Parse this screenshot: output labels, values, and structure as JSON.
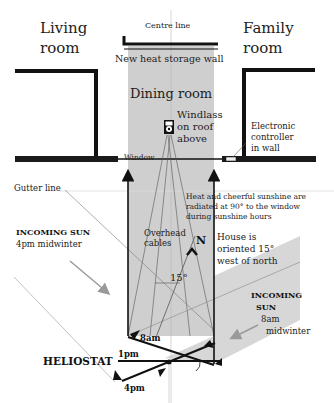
{
  "rooms": {
    "living": [
      "Living",
      "room"
    ],
    "family": [
      "Family",
      "room"
    ],
    "dining": "Dining room"
  },
  "labels": {
    "centre_line": "Centre line",
    "heat_wall": "New heat storage wall",
    "windlass": [
      "Windlass",
      "on roof",
      "above"
    ],
    "controller": [
      "Electronic",
      "controller",
      "in wall"
    ],
    "window": "Window",
    "gutter": "Gutter line",
    "radiated": [
      "Heat and cheerful sunshine are",
      "radiated at 90° to the window",
      "during sunshine hours"
    ],
    "cables": [
      "Overhead",
      "cables"
    ],
    "north": "N",
    "orientation": [
      "House is",
      "oriented 15°",
      "west of north"
    ],
    "angle": "15°",
    "sun_4pm": {
      "title": "INCOMING SUN",
      "sub": "4pm midwinter"
    },
    "sun_8am": {
      "title": [
        "INCOMING",
        "SUN"
      ],
      "sub": [
        "8am",
        "midwinter"
      ]
    },
    "heliostat": "HELIOSTAT",
    "t_8am": "8am",
    "t_1pm": "1pm",
    "t_4pm": "4pm"
  },
  "colors": {
    "beam": "#cfcfcf",
    "wall": "#111111",
    "arrow_grey": "#9a9a9a"
  }
}
